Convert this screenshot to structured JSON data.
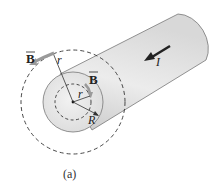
{
  "diagram": {
    "caption": "(a)",
    "labels": {
      "b_outer": "B",
      "b_inner": "B",
      "r_outer": "r",
      "r_inner": "r",
      "radius": "R",
      "current": "I"
    },
    "colors": {
      "cylinder_fill": "#e6e6e6",
      "cylinder_shade": "#cfcfcf",
      "end_face": "#eeeeee",
      "outline": "#666666",
      "dashed": "#333333",
      "field_arrow": "#9a9a9a",
      "current_arrow": "#222222"
    }
  }
}
